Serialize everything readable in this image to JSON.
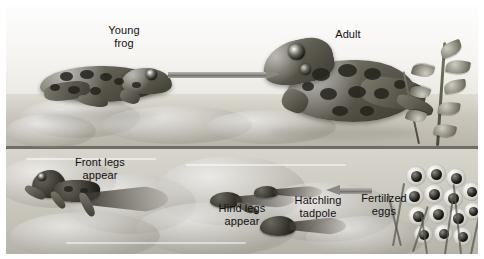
{
  "figure": {
    "media": "grayscale scientific illustration"
  },
  "labels": {
    "young_frog": "Young\nfrog",
    "adult": "Adult",
    "front_legs": "Front legs\nappear",
    "hind_legs": "Hind legs\nappear",
    "hatchling_tadpole": "Hatchling\ntadpole",
    "fertilized_eggs": "Fertilized\neggs"
  },
  "arrows": [
    {
      "name": "young-frog-to-adult",
      "direction": "right"
    },
    {
      "name": "fertilized-eggs-to-hatchling",
      "direction": "left"
    }
  ],
  "colors": {
    "plate_background": "#e9e7e2",
    "water": "#c7c4ba",
    "waterline": "#6f6d66",
    "arrow": "#8a8882",
    "label_text": "#121212",
    "page_background": "#ffffff"
  },
  "organisms": [
    {
      "name": "young-frog",
      "stage": "young frog"
    },
    {
      "name": "adult-frog",
      "stage": "adult"
    },
    {
      "name": "froglet-front-legs",
      "stage": "front legs appear"
    },
    {
      "name": "tadpole-hind-legs",
      "stage": "hind legs appear"
    },
    {
      "name": "hatchling-tadpole",
      "stage": "hatchling tadpole"
    },
    {
      "name": "egg-mass",
      "stage": "fertilized eggs"
    }
  ]
}
